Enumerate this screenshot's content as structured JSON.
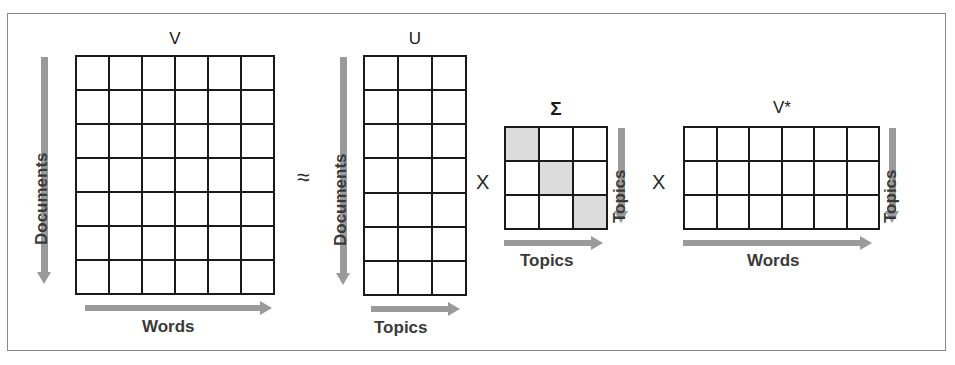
{
  "figure": {
    "title_operator_approx": "≈",
    "operator_multiply_1": "X",
    "operator_multiply_2": "X",
    "accent_grid_color": "#1a1a1a",
    "accent_arrow_color": "#9a9a9a",
    "accent_shaded_cell_color": "#dcdcdc",
    "frame_color": "#888888"
  },
  "matrices": [
    {
      "name": "V",
      "rows": 7,
      "cols": 6,
      "row_axis_label": "Documents",
      "col_axis_label": "Words",
      "row_axis_side": "left",
      "shaded_diagonal": false
    },
    {
      "name": "U",
      "rows": 7,
      "cols": 3,
      "row_axis_label": "Documents",
      "col_axis_label": "Topics",
      "row_axis_side": "left",
      "shaded_diagonal": false
    },
    {
      "name": "Σ",
      "rows": 3,
      "cols": 3,
      "row_axis_label": "Topics",
      "col_axis_label": "Topics",
      "row_axis_side": "right",
      "shaded_diagonal": true
    },
    {
      "name": "V*",
      "rows": 3,
      "cols": 6,
      "row_axis_label": "Topics",
      "col_axis_label": "Words",
      "row_axis_side": "right",
      "shaded_diagonal": false
    }
  ]
}
